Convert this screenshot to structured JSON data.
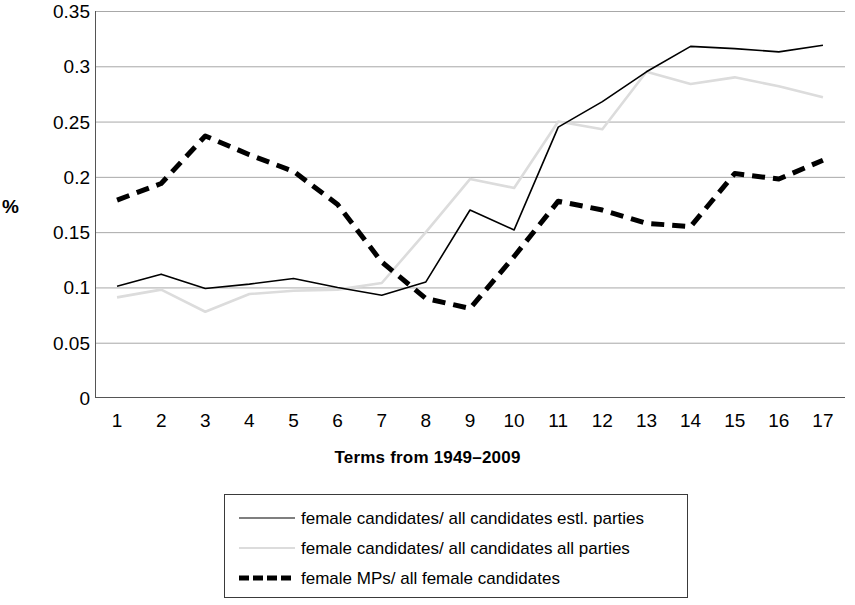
{
  "chart_data": {
    "type": "line",
    "title": "",
    "xlabel": "Terms from 1949–2009",
    "ylabel": "%",
    "x": [
      1,
      2,
      3,
      4,
      5,
      6,
      7,
      8,
      9,
      10,
      11,
      12,
      13,
      14,
      15,
      16,
      17
    ],
    "categories": [
      "1",
      "2",
      "3",
      "4",
      "5",
      "6",
      "7",
      "8",
      "9",
      "10",
      "11",
      "12",
      "13",
      "14",
      "15",
      "16",
      "17"
    ],
    "ylim": [
      0,
      0.35
    ],
    "ytick_labels": [
      "0.35",
      "0.3",
      "0.25",
      "0.2",
      "0.15",
      "0.1",
      "0.05",
      "0"
    ],
    "ytick_values": [
      0.35,
      0.3,
      0.25,
      0.2,
      0.15,
      0.1,
      0.05,
      0
    ],
    "grid": true,
    "legend_position": "bottom",
    "series": [
      {
        "name": "female candidates/ all candidates estl. parties",
        "style": "solid",
        "color": "#000000",
        "width": 1.6,
        "values": [
          0.101,
          0.112,
          0.099,
          0.103,
          0.108,
          0.1,
          0.093,
          0.105,
          0.17,
          0.152,
          0.245,
          0.268,
          0.295,
          0.318,
          0.316,
          0.313,
          0.319
        ]
      },
      {
        "name": "female candidates/ all candidates all parties",
        "style": "solid",
        "color": "#dcdcdc",
        "width": 2.6,
        "values": [
          0.091,
          0.098,
          0.078,
          0.094,
          0.097,
          0.098,
          0.104,
          0.15,
          0.198,
          0.19,
          0.25,
          0.243,
          0.295,
          0.284,
          0.29,
          0.282,
          0.272
        ]
      },
      {
        "name": "female MPs/ all female candidates",
        "style": "dashed",
        "color": "#000000",
        "width": 5,
        "values": [
          0.179,
          0.194,
          0.237,
          0.22,
          0.205,
          0.175,
          0.123,
          0.09,
          0.081,
          0.128,
          0.178,
          0.17,
          0.158,
          0.155,
          0.203,
          0.198,
          0.215
        ]
      }
    ]
  },
  "legend": {
    "items": [
      {
        "label": "female candidates/ all candidates estl. parties",
        "swatch": "solid-line-icon"
      },
      {
        "label": "female candidates/ all candidates all parties",
        "swatch": "gray-line-icon"
      },
      {
        "label": "female MPs/ all female candidates",
        "swatch": "dashed-line-icon"
      }
    ]
  }
}
